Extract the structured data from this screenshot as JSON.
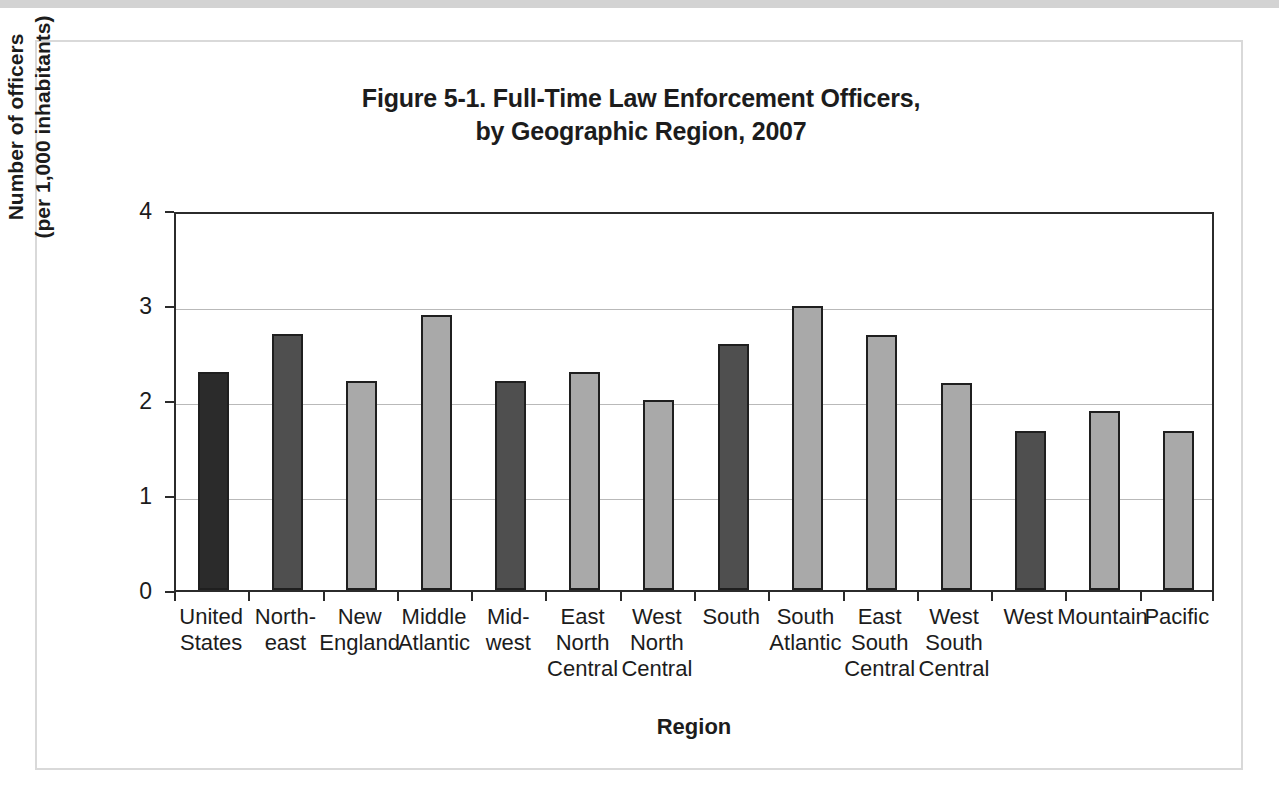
{
  "figure": {
    "title_line1": "Figure 5-1. Full-Time Law Enforcement Officers,",
    "title_line2": "by Geographic Region, 2007"
  },
  "axis": {
    "y_title_line1": "Number of officers",
    "y_title_line2": "(per 1,000 inhabitants)",
    "x_title": "Region"
  },
  "colors": {
    "bar_dark": "#2b2b2b",
    "bar_medium": "#4f4f4f",
    "bar_light": "#a9a9a9",
    "bar_outline": "#1f1f1f",
    "gridline": "#b9b9b9",
    "axis": "#2b2b2b",
    "text": "#1c1c1c",
    "frame": "#d9d9d9",
    "top_band": "#d3d3d3"
  },
  "chart_data": {
    "type": "bar",
    "title": "Figure 5-1. Full-Time Law Enforcement Officers, by Geographic Region, 2007",
    "xlabel": "Region",
    "ylabel": "Number of officers (per 1,000 inhabitants)",
    "ylim": [
      0,
      4
    ],
    "yticks": [
      0,
      1,
      2,
      3,
      4
    ],
    "ytick_labels": [
      "0",
      "1",
      "2",
      "3",
      "4"
    ],
    "grid": true,
    "legend": "none",
    "categories": [
      "United States",
      "North-east",
      "New England",
      "Middle Atlantic",
      "Mid-west",
      "East North Central",
      "West North Central",
      "South",
      "South Atlantic",
      "East South Central",
      "West South Central",
      "West",
      "Mountain",
      "Pacific"
    ],
    "category_label_lines": [
      [
        "United",
        "States"
      ],
      [
        "North-",
        "east"
      ],
      [
        "New",
        "England"
      ],
      [
        "Middle",
        "Atlantic"
      ],
      [
        "Mid-",
        "west"
      ],
      [
        "East",
        "North",
        "Central"
      ],
      [
        "West",
        "North",
        "Central"
      ],
      [
        "South"
      ],
      [
        "South",
        "Atlantic"
      ],
      [
        "East",
        "South",
        "Central"
      ],
      [
        "West",
        "South",
        "Central"
      ],
      [
        "West"
      ],
      [
        "Mountain"
      ],
      [
        "Pacific"
      ]
    ],
    "values": [
      2.3,
      2.7,
      2.2,
      2.9,
      2.2,
      2.3,
      2.0,
      2.59,
      2.99,
      2.68,
      2.18,
      1.67,
      1.88,
      1.67
    ],
    "bar_shades": [
      "dark",
      "medium",
      "light",
      "light",
      "medium",
      "light",
      "light",
      "medium",
      "light",
      "light",
      "light",
      "medium",
      "light",
      "light"
    ]
  }
}
